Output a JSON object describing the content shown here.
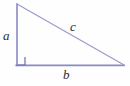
{
  "figure": {
    "name": "right-triangle-labeled-abc",
    "background_color": "#fefefe",
    "width": 130,
    "height": 86
  },
  "style": {
    "leg_color": "#8a8ac4",
    "hypotenuse_color": "#9a9ad0",
    "right_angle_color": "#6f6fae",
    "label_color": "#2b2b2b",
    "leg_stroke_width": 1.6,
    "hypotenuse_stroke_width": 1.2,
    "right_angle_stroke_width": 1.2
  },
  "geometry": {
    "apex_top": {
      "x": 17,
      "y": 4
    },
    "right_angle_vertex": {
      "x": 17,
      "y": 65
    },
    "right_vertex": {
      "x": 124,
      "y": 65
    },
    "right_angle_marker": {
      "x": 17,
      "y": 57,
      "size": 8
    }
  },
  "labels": {
    "leg_vertical": "a",
    "leg_horizontal": "b",
    "hypotenuse": "c"
  },
  "chart_data": {
    "type": "diagram",
    "title": "",
    "shape": "right triangle",
    "sides": [
      {
        "name": "a",
        "role": "vertical leg",
        "from": "apex_top",
        "to": "right_angle_vertex"
      },
      {
        "name": "b",
        "role": "horizontal leg",
        "from": "right_angle_vertex",
        "to": "right_vertex"
      },
      {
        "name": "c",
        "role": "hypotenuse",
        "from": "apex_top",
        "to": "right_vertex"
      }
    ],
    "right_angle_at": "bottom-left vertex"
  }
}
